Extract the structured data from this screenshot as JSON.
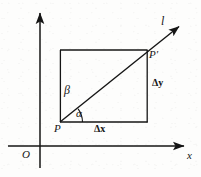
{
  "figure": {
    "kind": "geometry-diagram",
    "background_color": "#fdfdfc",
    "ink_color": "#151515"
  },
  "axes": {
    "origin_label": "O",
    "x_axis_label": "x",
    "y_axis_label": "",
    "x_axis": {
      "y": 146,
      "x_start": 8,
      "x_end": 186,
      "arrow": "right"
    },
    "y_axis": {
      "x": 40,
      "y_start": 168,
      "y_end": 11,
      "arrow": "up"
    }
  },
  "line": {
    "label": "l",
    "from_point": "P",
    "to_point": "P'",
    "arrow": "up-right",
    "start": [
      60,
      122
    ],
    "end": [
      182,
      24
    ]
  },
  "points": [
    {
      "label": "P",
      "x": 60,
      "y": 122,
      "role": "start-point"
    },
    {
      "label": "P'",
      "x": 147,
      "y": 50,
      "role": "end-point"
    }
  ],
  "rectangle": {
    "left": 60,
    "right": 147,
    "top": 50,
    "bottom": 122,
    "stroke": "#151515"
  },
  "angles": [
    {
      "label": "α",
      "symbol": "alpha",
      "vertex": "P",
      "between": "x-direction and line l"
    },
    {
      "label": "β",
      "symbol": "beta",
      "vertex": "P",
      "between": "line l and vertical side"
    }
  ],
  "segments": [
    {
      "label": "Δx",
      "delta": "x",
      "meaning": "horizontal run from P to P'",
      "position": "below rectangle"
    },
    {
      "label": "Δy",
      "delta": "y",
      "meaning": "vertical rise from P to P'",
      "position": "right of rectangle"
    }
  ],
  "labels": {
    "line_l": "l",
    "point_p": "P",
    "point_p_prime": "P′",
    "alpha": "α",
    "beta": "β",
    "delta_x": "Δx",
    "delta_y": "Δy",
    "origin": "O",
    "axis_x": "x"
  }
}
